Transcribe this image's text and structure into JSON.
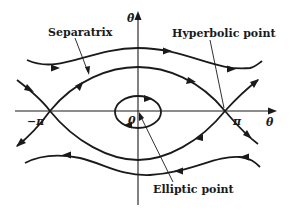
{
  "figure": {
    "type": "phase-portrait",
    "axes": {
      "x_label": "θ",
      "y_label": "θ̇",
      "origin_label": "0",
      "tick_labels": [
        "−π",
        "π"
      ]
    },
    "annotations": {
      "separatrix": "Separatrix",
      "hyperbolic_point": "Hyperbolic point",
      "elliptic_point": "Elliptic point"
    },
    "colors": {
      "ink": "#1a1a1a",
      "background": "#ffffff"
    }
  }
}
